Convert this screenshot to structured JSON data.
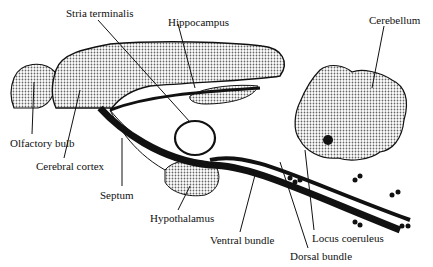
{
  "diagram": {
    "colors": {
      "ink": "#111111",
      "stipple": "#9a9a9a",
      "background": "#ffffff"
    },
    "labels": {
      "stria_terminalis": {
        "text": "Stria terminalis",
        "x": 66,
        "y": 7
      },
      "hippocampus": {
        "text": "Hippocampus",
        "x": 168,
        "y": 16
      },
      "cerebellum": {
        "text": "Cerebellum",
        "x": 369,
        "y": 14
      },
      "olfactory_bulb": {
        "text": "Olfactory bulb",
        "x": 10,
        "y": 137
      },
      "cerebral_cortex": {
        "text": "Cerebral cortex",
        "x": 36,
        "y": 160
      },
      "septum": {
        "text": "Septum",
        "x": 100,
        "y": 189
      },
      "hypothalamus": {
        "text": "Hypothalamus",
        "x": 150,
        "y": 212
      },
      "ventral_bundle": {
        "text": "Ventral bundle",
        "x": 210,
        "y": 234
      },
      "locus_coeruleus": {
        "text": "Locus coeruleus",
        "x": 312,
        "y": 232
      },
      "dorsal_bundle": {
        "text": "Dorsal bundle",
        "x": 290,
        "y": 250
      }
    }
  }
}
